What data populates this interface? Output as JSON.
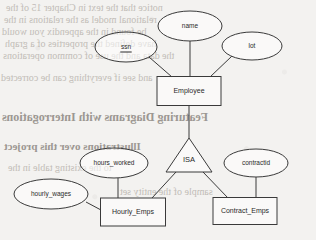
{
  "diagram": {
    "type": "er-diagram",
    "entities": [
      {
        "id": "employee",
        "label": "Employee",
        "shape": "rectangle",
        "x": 189,
        "y": 91,
        "w": 64,
        "h": 29
      },
      {
        "id": "hourly_emps",
        "label": "Hourly_Emps",
        "shape": "rectangle",
        "x": 133,
        "y": 212,
        "w": 65,
        "h": 28
      },
      {
        "id": "contract_emps",
        "label": "Contract_Emps",
        "shape": "rectangle",
        "x": 245,
        "y": 211,
        "w": 64,
        "h": 27
      }
    ],
    "attributes": [
      {
        "id": "name",
        "label": "name",
        "shape": "ellipse",
        "x": 190,
        "y": 26,
        "rx": 32,
        "ry": 15,
        "key": false
      },
      {
        "id": "ssn",
        "label": "ssn",
        "shape": "ellipse",
        "x": 126,
        "y": 47,
        "rx": 31,
        "ry": 15,
        "key": true
      },
      {
        "id": "lot",
        "label": "lot",
        "shape": "ellipse",
        "x": 252,
        "y": 46,
        "rx": 30,
        "ry": 14,
        "key": false
      },
      {
        "id": "hours_worked",
        "label": "hours_worked",
        "shape": "ellipse",
        "x": 114,
        "y": 163,
        "rx": 34,
        "ry": 15,
        "key": false
      },
      {
        "id": "hourly_wages",
        "label": "hourly_wages",
        "shape": "ellipse",
        "x": 51,
        "y": 194,
        "rx": 37,
        "ry": 15,
        "key": false
      },
      {
        "id": "contractid",
        "label": "contractid",
        "shape": "ellipse",
        "x": 256,
        "y": 163,
        "rx": 32,
        "ry": 14,
        "key": false
      }
    ],
    "relationships": [
      {
        "id": "isa",
        "label": "ISA",
        "shape": "triangle",
        "x": 189,
        "y": 155,
        "w": 46,
        "h": 34
      }
    ],
    "edges": [
      {
        "id": "edge-name-employee",
        "from": "name",
        "to": "employee",
        "x1": 190,
        "y1": 41,
        "x2": 190,
        "y2": 77
      },
      {
        "id": "edge-ssn-employee",
        "from": "ssn",
        "to": "employee",
        "x1": 149,
        "y1": 57,
        "x2": 172,
        "y2": 77
      },
      {
        "id": "edge-lot-employee",
        "from": "lot",
        "to": "employee",
        "x1": 232,
        "y1": 56,
        "x2": 210,
        "y2": 77
      },
      {
        "id": "edge-employee-isa",
        "from": "employee",
        "to": "isa",
        "x1": 189,
        "y1": 106,
        "x2": 189,
        "y2": 138
      },
      {
        "id": "edge-isa-hourly",
        "from": "isa",
        "to": "hourly_emps",
        "x1": 176,
        "y1": 172,
        "x2": 152,
        "y2": 198
      },
      {
        "id": "edge-isa-contract",
        "from": "isa",
        "to": "contract_emps",
        "x1": 203,
        "y1": 172,
        "x2": 228,
        "y2": 198
      },
      {
        "id": "edge-hoursworked-hourly",
        "from": "hours_worked",
        "to": "hourly_emps",
        "x1": 118,
        "y1": 178,
        "x2": 118,
        "y2": 198
      },
      {
        "id": "edge-hourlywages-hourly",
        "from": "hourly_wages",
        "to": "hourly_emps",
        "x1": 86,
        "y1": 202,
        "x2": 101,
        "y2": 210
      },
      {
        "id": "edge-contractid-contract",
        "from": "contractid",
        "to": "contract_emps",
        "x1": 256,
        "y1": 177,
        "x2": 256,
        "y2": 198
      }
    ]
  },
  "background_text": {
    "description": "faint mirrored bleed-through text from the reverse page of the scan",
    "lines": [
      {
        "id": "b1",
        "text": "notice that the text in Chapter 15 of the",
        "x": 6,
        "y": 2,
        "size": 10,
        "heavy": false
      },
      {
        "id": "b2",
        "text": "relational model as the relations in the",
        "x": 4,
        "y": 14,
        "size": 10,
        "heavy": false
      },
      {
        "id": "b3",
        "text": "be found in the appendix you would",
        "x": 2,
        "y": 26,
        "size": 10,
        "heavy": false
      },
      {
        "id": "b4",
        "text": "have defined the properties of a graph",
        "x": 5,
        "y": 38,
        "size": 10,
        "heavy": false
      },
      {
        "id": "b5",
        "text": "the data and the use of common operations",
        "x": 3,
        "y": 50,
        "size": 10,
        "heavy": false
      },
      {
        "id": "b6",
        "text": "and see if everything can be corrected",
        "x": 1,
        "y": 72,
        "size": 10,
        "heavy": false
      },
      {
        "id": "b7",
        "text": "Featuring Diagrams with Interrogations",
        "x": 2,
        "y": 110,
        "size": 12,
        "heavy": true
      },
      {
        "id": "b8",
        "text": "Illustrations over this project",
        "x": 4,
        "y": 140,
        "size": 11,
        "heavy": true
      },
      {
        "id": "b9",
        "text": "to the existing table in the",
        "x": 8,
        "y": 162,
        "size": 10,
        "heavy": false
      },
      {
        "id": "b10",
        "text": "sample of the entity set",
        "x": 120,
        "y": 186,
        "size": 10,
        "heavy": false
      }
    ]
  }
}
